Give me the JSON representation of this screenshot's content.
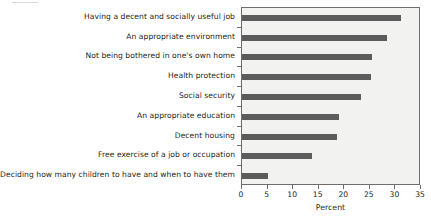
{
  "chart_data": {
    "type": "bar",
    "orientation": "horizontal",
    "title": "",
    "xlabel": "Percent",
    "ylabel": "",
    "xlim": [
      0,
      35
    ],
    "xticks": [
      0,
      5,
      10,
      15,
      20,
      25,
      30,
      35
    ],
    "xtick_labels": [
      "0",
      "5",
      "10",
      "15",
      "20",
      "25",
      "30",
      "35"
    ],
    "grid": false,
    "legend": false,
    "bar_color": "#5c5c5c",
    "plot_background": "#f2f2f0",
    "frame_color": "#6e6e6e",
    "categories": [
      "Having a decent and socially useful job",
      "An appropriate environment",
      "Not being bothered in one's own home",
      "Health protection",
      "Social security",
      "An appropriate education",
      "Decent housing",
      "Free exercise of a job or occupation",
      "Deciding how many children to have and when to have them"
    ],
    "values": [
      31.0,
      28.3,
      25.4,
      25.2,
      23.3,
      18.9,
      18.6,
      13.7,
      5.0
    ]
  },
  "axis": {
    "x_title": "Percent"
  }
}
